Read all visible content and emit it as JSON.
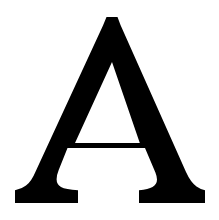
{
  "image": {
    "kind": "glyph-rendering",
    "width": 219,
    "height": 220,
    "background_color": "#ffffff"
  },
  "glyph": {
    "character": "A",
    "name": "latin-capital-letter-a",
    "description": "Capital letter A",
    "fill_color": "#000000",
    "style": "serif",
    "stroke_contrast": "thin-left-diagonal-thick-right-diagonal",
    "serif_style": "bracketed-slab-feet",
    "metrics": {
      "apex_top_y": 17,
      "apex_center_x": 112,
      "apex_flat_width": 10,
      "baseline_y": 203,
      "crossbar_top_y": 128,
      "crossbar_bottom_y": 143,
      "crossbar_left_x": 62,
      "crossbar_right_x": 145,
      "left_foot_left_x": 15,
      "left_foot_right_x": 78,
      "right_foot_left_x": 139,
      "right_foot_right_x": 205,
      "counter_apex_y": 58
    }
  }
}
